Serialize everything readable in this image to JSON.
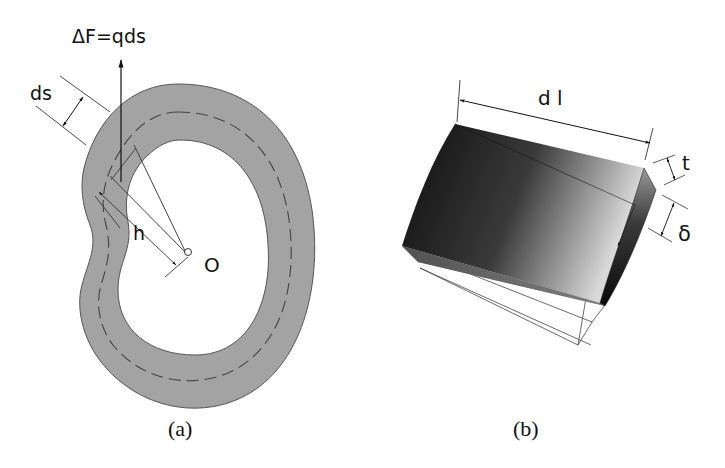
{
  "figure": {
    "panel_a": {
      "caption": "(a)",
      "force_label": "ΔF=qds",
      "ds_label": "ds",
      "h_label": "h",
      "origin_label": "O",
      "ring_fill": "#a3a3a3",
      "ring_stroke": "#555555"
    },
    "panel_b": {
      "caption": "(b)",
      "dl_label": "d l",
      "t_label": "t",
      "delta_label": "δ",
      "block_dark": "#1a1a1a",
      "block_light": "#d8d8d8"
    }
  }
}
